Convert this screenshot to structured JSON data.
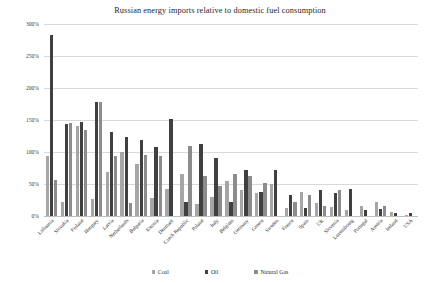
{
  "chart_data": {
    "type": "bar",
    "title": "Russian energy imports relative to domestic fuel consumption",
    "xlabel": "",
    "ylabel": "",
    "ylim": [
      0,
      300
    ],
    "ytick_labels": [
      "0%",
      "50%",
      "100%",
      "150%",
      "200%",
      "250%",
      "300%"
    ],
    "ytick_values": [
      0,
      50,
      100,
      150,
      200,
      250,
      300
    ],
    "grid": true,
    "legend_position": "bottom",
    "categories": [
      "Lithuania",
      "Slovakia",
      "Finland",
      "Hungary",
      "Latvia",
      "Netherlands",
      "Bulgaria",
      "Estonia",
      "Denmark",
      "Czech Republic",
      "Poland",
      "Italy",
      "Belgium",
      "Germany",
      "Greece",
      "Sweden",
      "France",
      "Spain",
      "UK",
      "Slovenia",
      "Luxembourg",
      "Portugal",
      "Austria",
      "Ireland",
      "USA"
    ],
    "series": [
      {
        "name": "Coal",
        "color": "#a6a6a6",
        "values": [
          93,
          22,
          140,
          26,
          68,
          100,
          82,
          28,
          42,
          65,
          18,
          30,
          55,
          40,
          36,
          50,
          12,
          38,
          20,
          14,
          10,
          16,
          22,
          6,
          2
        ]
      },
      {
        "name": "Oil",
        "color": "#404040",
        "values": [
          283,
          143,
          147,
          178,
          131,
          124,
          119,
          108,
          152,
          22,
          112,
          91,
          22,
          72,
          38,
          72,
          33,
          12,
          40,
          36,
          42,
          10,
          11,
          5,
          4
        ]
      },
      {
        "name": "Natural Gas",
        "color": "#8c8c8c",
        "values": [
          57,
          145,
          134,
          178,
          94,
          21,
          96,
          93,
          0,
          110,
          62,
          47,
          66,
          62,
          52,
          0,
          22,
          33,
          15,
          40,
          0,
          0,
          16,
          0,
          0
        ]
      }
    ]
  },
  "legend": {
    "items": [
      {
        "label": "Coal",
        "key": "coal"
      },
      {
        "label": "Oil",
        "key": "oil"
      },
      {
        "label": "Natural Gas",
        "key": "gas"
      }
    ]
  }
}
